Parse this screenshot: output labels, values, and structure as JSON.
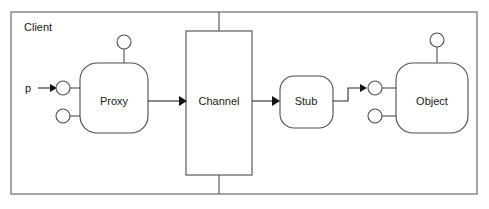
{
  "diagram": {
    "title_label": "Client",
    "frame": {
      "name": "client-boundary",
      "x": 11,
      "y": 12,
      "width": 466,
      "height": 182
    },
    "parameter_label": "p",
    "nodes": [
      {
        "id": "proxy",
        "label": "Proxy",
        "shape": "rounded-rect",
        "x": 80,
        "y": 63,
        "width": 68,
        "height": 70
      },
      {
        "id": "channel",
        "label": "Channel",
        "shape": "rect",
        "x": 186,
        "y": 31,
        "width": 66,
        "height": 144
      },
      {
        "id": "stub",
        "label": "Stub",
        "shape": "rounded-rect",
        "x": 280,
        "y": 76,
        "width": 53,
        "height": 52
      },
      {
        "id": "object",
        "label": "Object",
        "shape": "rounded-rect",
        "x": 396,
        "y": 63,
        "width": 72,
        "height": 70
      }
    ],
    "ports": [
      {
        "id": "proxy-top-port",
        "owner": "proxy",
        "cx": 124,
        "cy": 42,
        "r": 7
      },
      {
        "id": "proxy-left-upper-port",
        "owner": "proxy",
        "cx": 63,
        "cy": 88,
        "r": 7
      },
      {
        "id": "proxy-left-lower-port",
        "owner": "proxy",
        "cx": 63,
        "cy": 116,
        "r": 7
      },
      {
        "id": "object-top-port",
        "owner": "object",
        "cx": 437,
        "cy": 40,
        "r": 7
      },
      {
        "id": "object-left-upper-port",
        "owner": "object",
        "cx": 375,
        "cy": 88,
        "r": 7
      },
      {
        "id": "object-left-lower-port",
        "owner": "object",
        "cx": 375,
        "cy": 116,
        "r": 7
      }
    ],
    "connections": [
      {
        "id": "param-to-proxy",
        "from": "p",
        "to": "proxy-left-upper-port",
        "arrow": true
      },
      {
        "id": "proxy-to-channel",
        "from": "proxy",
        "to": "channel",
        "arrow": true
      },
      {
        "id": "channel-to-stub",
        "from": "channel",
        "to": "stub",
        "arrow": true
      },
      {
        "id": "stub-to-object",
        "from": "stub",
        "to": "object-left-upper-port",
        "arrow": true
      }
    ],
    "colors": {
      "background": "#ffffff",
      "node_stroke": "#4d4d4d",
      "frame_stroke": "#6b6b6b",
      "connector_stroke": "#2b2b2b",
      "text": "#1a1a1a"
    }
  }
}
